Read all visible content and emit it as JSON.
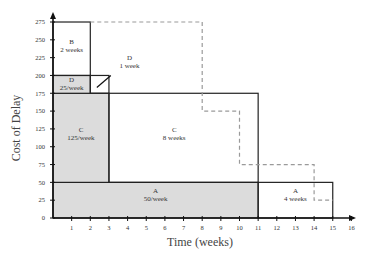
{
  "chart_data": {
    "type": "area",
    "title": "",
    "xlabel": "Time (weeks)",
    "ylabel": "Cost of Delay",
    "xlim": [
      0,
      16
    ],
    "ylim": [
      0,
      275
    ],
    "x_ticks": [
      1,
      2,
      3,
      4,
      5,
      6,
      7,
      8,
      9,
      10,
      11,
      12,
      13,
      14,
      15,
      16
    ],
    "y_ticks": [
      0,
      25,
      50,
      75,
      100,
      125,
      150,
      175,
      200,
      225,
      250,
      275
    ],
    "grid": false,
    "blocks": [
      {
        "name": "A",
        "rate_label": "50/week",
        "x0": 0,
        "x1": 11,
        "y0": 0,
        "y1": 50,
        "shaded": true
      },
      {
        "name": "C",
        "rate_label": "125/week",
        "x0": 0,
        "x1": 3,
        "y0": 50,
        "y1": 175,
        "shaded": true
      },
      {
        "name": "D",
        "rate_label": "25/week",
        "x0": 0,
        "x1": 2,
        "y0": 175,
        "y1": 200,
        "shaded": true
      },
      {
        "name": "B",
        "duration_label": "2 weeks",
        "x0": 0,
        "x1": 2,
        "y0": 200,
        "y1": 275,
        "shaded": false
      },
      {
        "name": "D",
        "duration_label": "1 week",
        "x0": 2,
        "x1": 3,
        "y0": 175,
        "y1": 200,
        "shaded": false
      },
      {
        "name": "C",
        "duration_label": "8 weeks",
        "x0": 3,
        "x1": 11,
        "y0": 50,
        "y1": 175,
        "shaded": false
      },
      {
        "name": "A",
        "duration_label": "4 weeks",
        "x0": 11,
        "x1": 15,
        "y0": 0,
        "y1": 50,
        "shaded": false
      }
    ],
    "dashed_series": {
      "name": "alternative sequence",
      "points": [
        [
          2,
          275
        ],
        [
          8,
          275
        ],
        [
          8,
          150
        ],
        [
          10,
          150
        ],
        [
          10,
          75
        ],
        [
          14,
          75
        ],
        [
          14,
          25
        ],
        [
          15,
          25
        ]
      ]
    },
    "labels": {
      "B_top": {
        "name": "B",
        "text": "2 weeks"
      },
      "D_shaded": {
        "name": "D",
        "text": "25/week"
      },
      "D_callout": {
        "name": "D",
        "text": "1 week"
      },
      "C_shaded": {
        "name": "C",
        "text": "125/week"
      },
      "C_white": {
        "name": "C",
        "text": "8 weeks"
      },
      "A_shaded": {
        "name": "A",
        "text": "50/week"
      },
      "A_white": {
        "name": "A",
        "text": "4 weeks"
      }
    }
  }
}
